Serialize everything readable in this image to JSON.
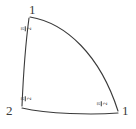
{
  "figure": {
    "background_color": "#ffffff",
    "stroke_color": "#3a3a3a",
    "stroke_width": 1,
    "width": 136,
    "height": 129,
    "vertices": [
      {
        "id": "v-top-left",
        "label": "1",
        "x": 33,
        "y": 10
      },
      {
        "id": "v-bottom-left",
        "label": "2",
        "x": 10,
        "y": 113
      },
      {
        "id": "v-bottom-right",
        "label": "1",
        "x": 121,
        "y": 113
      }
    ],
    "edge_labels": [
      {
        "id": "edge-left",
        "numerator": "π",
        "denominator": "2",
        "x": 25,
        "y": 27,
        "rotation": -90
      },
      {
        "id": "edge-bottom",
        "numerator": "π",
        "denominator": "2",
        "x": 25,
        "y": 97,
        "rotation": -90
      },
      {
        "id": "edge-right",
        "numerator": "π",
        "denominator": "2",
        "x": 101,
        "y": 102,
        "rotation": -90
      }
    ],
    "paths": {
      "left_edge": "M 29 18 C 25 48, 23 82, 22 106",
      "bottom_edge": "M 22 108 C 48 114, 92 115, 118 113",
      "arc_edge": "M 30 17 C 66 23, 100 55, 118 111"
    }
  }
}
